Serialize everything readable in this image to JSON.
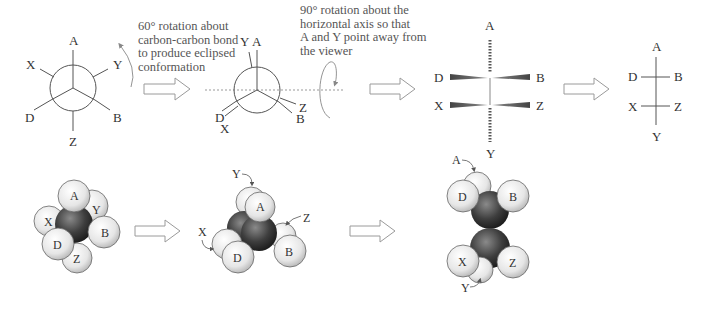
{
  "captions": {
    "step1": [
      "60° rotation about",
      "carbon-carbon bond",
      "to produce eclipsed",
      "conformation"
    ],
    "step2": [
      "90° rotation about the",
      "horizontal axis so that",
      "A and Y point away from",
      "the viewer"
    ]
  },
  "newman_staggered": {
    "labels": {
      "A": "A",
      "X": "X",
      "Y": "Y",
      "D": "D",
      "B": "B",
      "Z": "Z"
    }
  },
  "newman_eclipsed": {
    "labels": {
      "Y": "Y",
      "A": "A",
      "D": "D",
      "X": "X",
      "Z": "Z",
      "B": "B"
    }
  },
  "wedge_projection": {
    "labels": {
      "A": "A",
      "D": "D",
      "B": "B",
      "X": "X",
      "Z": "Z",
      "Y": "Y"
    }
  },
  "fischer_projection": {
    "labels": {
      "A": "A",
      "D": "D",
      "B": "B",
      "X": "X",
      "Z": "Z",
      "Y": "Y"
    }
  },
  "spacefill_staggered": {
    "labels": {
      "A": "A",
      "Y": "Y",
      "X": "X",
      "B": "B",
      "D": "D",
      "Z": "Z"
    }
  },
  "spacefill_eclipsed": {
    "labels": {
      "Y": "Y",
      "A": "A",
      "Z": "Z",
      "X": "X",
      "D": "D",
      "B": "B"
    }
  },
  "spacefill_vertical": {
    "labels": {
      "A": "A",
      "D": "D",
      "B": "B",
      "X": "X",
      "Z": "Z",
      "Y": "Y"
    }
  },
  "colors": {
    "line": "#555555",
    "arrow_outline": "#9a9a9a",
    "atom_light": "#f2f2f2",
    "atom_dark": "#3a3a3a"
  }
}
